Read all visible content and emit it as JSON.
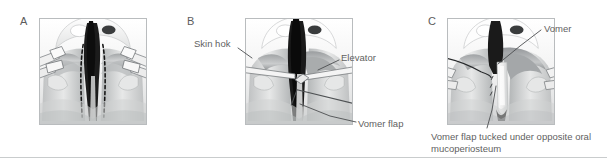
{
  "figure": {
    "kind": "surgical-illustration-series",
    "palette": {
      "frame_border": "#b9bcbe",
      "label_text": "#5f5f5f",
      "divider": "#c9cccd",
      "background": "#ffffff",
      "tissue_light": "#e9eaea",
      "tissue_mid": "#c4c6c7",
      "tissue_dark": "#8e9193",
      "cleft_black": "#1c1c1c",
      "instrument_fill": "#f1f1f1",
      "instrument_edge": "#7e8285"
    },
    "panels": [
      {
        "letter": "A",
        "caption_labels": [],
        "description": "Cleft palate viewed from below with dashed incision lines marked along the vomer",
        "dashed_incisions": 2
      },
      {
        "letter": "B",
        "caption_labels": [
          "Skin hok",
          "Elevator",
          "Vomer flap"
        ],
        "description": "Skin hook retracting tissue while an elevator raises the vomer flap",
        "instruments": [
          "skin-hook",
          "elevator"
        ]
      },
      {
        "letter": "C",
        "caption_labels": [
          "Vomer",
          "Vomer flap tucked under opposite oral mucoperiosteum"
        ],
        "description": "Vomer flap tucked beneath the contralateral oral mucoperiosteum with sutures in place",
        "instruments": [
          "suture-needle",
          "retractor-left",
          "retractor-right"
        ]
      }
    ],
    "labels": {
      "panel_a_letter": "A",
      "panel_b_letter": "B",
      "panel_c_letter": "C",
      "skin_hook": "Skin hok",
      "elevator": "Elevator",
      "vomer_flap": "Vomer flap",
      "vomer": "Vomer",
      "vomer_flap_tucked": "Vomer flap tucked under opposite oral mucoperiosteum"
    }
  }
}
